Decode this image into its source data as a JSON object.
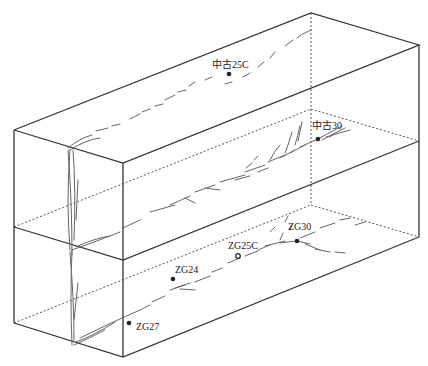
{
  "diagram": {
    "type": "3d block diagram of fault traces in stacked strata",
    "layers": [
      "upper layer",
      "middle layer",
      "lower layer"
    ],
    "colors": {
      "edge": "#333333",
      "fault": "#666666",
      "background": "#ffffff"
    },
    "wells": [
      {
        "id": "w1",
        "label": "中古25C",
        "x": 229,
        "y": 74,
        "style": "filled"
      },
      {
        "id": "w2",
        "label": "中古30",
        "x": 318,
        "y": 139,
        "style": "filled"
      },
      {
        "id": "w3",
        "label": "ZG30",
        "x": 297,
        "y": 241,
        "style": "filled"
      },
      {
        "id": "w4",
        "label": "ZG25C",
        "x": 238,
        "y": 256,
        "style": "open"
      },
      {
        "id": "w5",
        "label": "ZG24",
        "x": 173,
        "y": 279,
        "style": "filled"
      },
      {
        "id": "w6",
        "label": "ZG27",
        "x": 129,
        "y": 323,
        "style": "filled"
      }
    ]
  }
}
